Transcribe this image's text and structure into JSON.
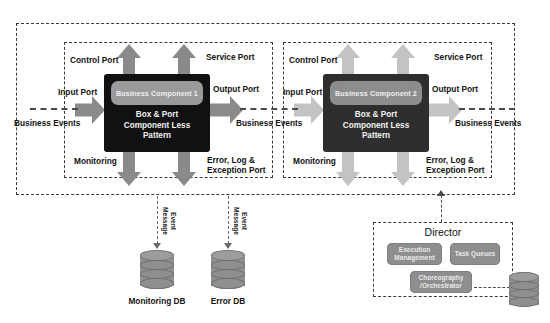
{
  "diagram": {
    "colors": {
      "component_body_dark": "#111111",
      "component_body_light": "#2e2e2e",
      "header_pill_dark": "#9a9a9a",
      "header_pill_light": "#8d8d8d",
      "arrow_dark": "#8a8a8a",
      "arrow_light": "#c3c3c3",
      "db_fill": "#8f8f8f",
      "dashed_border": "#3a3a3a",
      "director_pill": "#8e8e8e"
    },
    "components": [
      {
        "id": "component-1",
        "header": "Business Component 1",
        "body_lines": [
          "Box & Port",
          "Component Less",
          "Pattern"
        ],
        "ports": {
          "control": "Control Port",
          "service": "Service Port",
          "input": "Input Port",
          "output": "Output Port",
          "monitoring": "Monitoring",
          "error": "Error, Log &\nException Port"
        },
        "error_line1": "Error, Log &",
        "error_line2": "Exception Port"
      },
      {
        "id": "component-2",
        "header": "Business Component 2",
        "body_lines": [
          "Box & Port",
          "Component Less",
          "Pattern"
        ],
        "ports": {
          "control": "Control Port",
          "service": "Service Port",
          "input": "Input Port",
          "output": "Output Port",
          "monitoring": "Monitoring",
          "error": "Error, Log &\nException Port"
        },
        "error_line1": "Error, Log &",
        "error_line2": "Exception Port"
      }
    ],
    "event_flow": {
      "left_label": "Business Events",
      "middle_label": "Business Events",
      "right_label": "Business Events"
    },
    "message_labels": {
      "monitoring_channel": "Event\nMessage",
      "error_channel": "Event\nMessage"
    },
    "databases": [
      {
        "id": "monitoring-db",
        "label": "Monitoring DB"
      },
      {
        "id": "error-db",
        "label": "Error DB"
      },
      {
        "id": "director-db",
        "label": ""
      }
    ],
    "director": {
      "title": "Director",
      "modules": [
        {
          "id": "execution-management",
          "line1": "Execution",
          "line2": "Management"
        },
        {
          "id": "task-queues",
          "line1": "Task Queues",
          "line2": ""
        },
        {
          "id": "choreography-orchestrator",
          "line1": "Choreography",
          "line2": "/Orchestrator"
        }
      ]
    }
  }
}
